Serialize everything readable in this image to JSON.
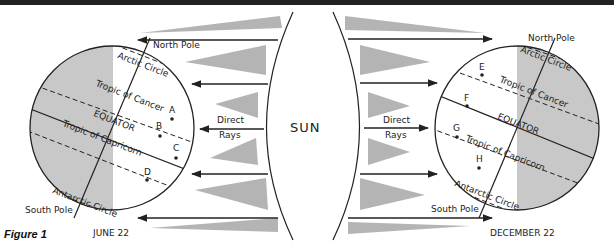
{
  "figure": {
    "label": "Figure 1",
    "center_label": "SUN",
    "left": {
      "date": "JUNE 22",
      "north_pole": "North Pole",
      "south_pole": "South Pole",
      "arctic": "Arctic Circle",
      "antarctic": "Antarctic Circle",
      "cancer": "Tropic of Cancer",
      "equator": "EQUATOR",
      "capricorn": "Tropic of Capricorn",
      "rays": [
        "Direct",
        "Rays"
      ],
      "points": [
        "A",
        "B",
        "C",
        "D"
      ]
    },
    "right": {
      "date": "DECEMBER 22",
      "north_pole": "North Pole",
      "south_pole": "South Pole",
      "arctic": "Arctic Circle",
      "antarctic": "Antarctic Circle",
      "cancer": "Tropic of Cancer",
      "equator": "EQUATOR",
      "capricorn": "Tropic of Capricorn",
      "rays": [
        "Direct",
        "Rays"
      ],
      "points": [
        "E",
        "F",
        "G",
        "H"
      ]
    },
    "colors": {
      "shade": "#c8c8c8",
      "line": "#222222",
      "ray_fill": "#9a9a9a"
    }
  }
}
